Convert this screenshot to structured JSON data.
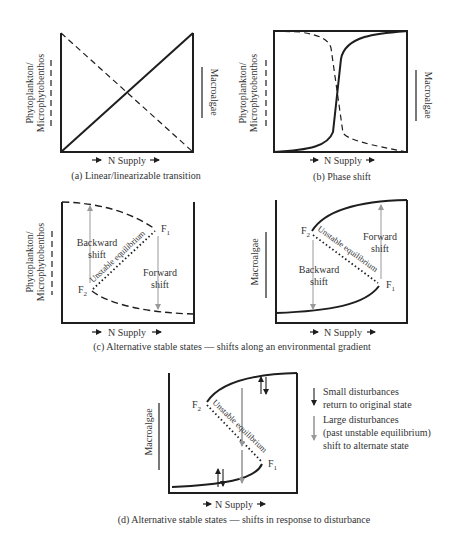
{
  "figure": {
    "panels": {
      "a": {
        "caption": "(a) Linear/linearizable transition",
        "x_label": "N Supply",
        "y_label_left_line1": "Phytoplankton/",
        "y_label_left_line2": "Microphytobenthos",
        "y_label_right": "Macroalgae"
      },
      "b": {
        "caption": "(b) Phase shift",
        "x_label": "N Supply",
        "y_label_left_line1": "Phytoplankton/",
        "y_label_left_line2": "Microphytobenthos",
        "y_label_right": "Macroalgae"
      },
      "c_left": {
        "x_label": "N Supply",
        "y_label_line1": "Phytoplankton/",
        "y_label_line2": "Microphytobenthos",
        "backward_line1": "Backward",
        "backward_line2": "shift",
        "forward_line1": "Forward",
        "forward_line2": "shift",
        "unstable": "Unstable equilibrium",
        "f1": "F",
        "f1_sub": "1",
        "f2": "F",
        "f2_sub": "2"
      },
      "c_right": {
        "x_label": "N Supply",
        "y_label": "Macroalgae",
        "backward_line1": "Backward",
        "backward_line2": "shift",
        "forward_line1": "Forward",
        "forward_line2": "shift",
        "unstable": "Unstable equilibrium",
        "f1": "F",
        "f1_sub": "1",
        "f2": "F",
        "f2_sub": "2"
      },
      "c_caption": "(c) Alternative stable states — shifts along an environmental gradient",
      "d": {
        "caption": "(d) Alternative stable states — shifts in response to disturbance",
        "x_label": "N Supply",
        "y_label": "Macroalgae",
        "unstable": "Unstable equilibrium",
        "f1": "F",
        "f1_sub": "1",
        "f2": "F",
        "f2_sub": "2",
        "legend": {
          "small_line1": "Small disturbances",
          "small_line2": "return to original state",
          "large_line1": "Large disturbances",
          "large_line2": "(past unstable equilibrium)",
          "large_line3": "shift to alternate state"
        }
      }
    },
    "colors": {
      "line": "#1e1e1e",
      "gray_arrow": "#999999",
      "text": "#333333"
    }
  }
}
